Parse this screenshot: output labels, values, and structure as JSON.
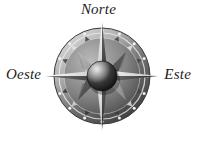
{
  "image": {
    "title": "Rosa de los vientos",
    "subject": "compass-rose",
    "width": 197,
    "height": 148,
    "background_color": "#ffffff",
    "palette": {
      "text": "#1d1d1d",
      "metal_light": "#f2f2f2",
      "metal_mid": "#a9a9a9",
      "metal_dark": "#4a4a4a",
      "metal_shadow": "#2b2b2b",
      "ring_edge": "#6d6d6d",
      "sphere_dark": "#151515",
      "sphere_highlight": "#d8d8d8"
    }
  },
  "labels": {
    "north": "Norte",
    "west": "Oeste",
    "east": "Este"
  },
  "compass": {
    "center_x": 102,
    "center_y": 76,
    "ring_outer_radius": 48,
    "ring_inner_radius": 38,
    "star_points": 8,
    "north_tip_y": 22,
    "south_tip_y": 130,
    "west_tip_x": 45,
    "east_tip_x": 158,
    "hub_radius": 15
  }
}
